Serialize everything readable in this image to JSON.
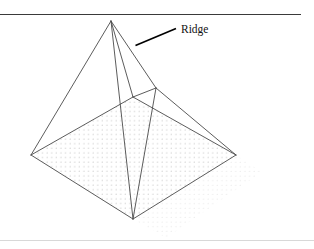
{
  "figure": {
    "type": "line-diagram",
    "background_color": "#ffffff",
    "canvas": {
      "width": 314,
      "height": 249
    }
  },
  "rules": {
    "top": {
      "name": "top-horizontal-rule",
      "x1": 0,
      "y1": 14.5,
      "x2": 301,
      "y2": 14.5,
      "color": "#3a3a3a",
      "width": 1.1
    },
    "bottom": {
      "name": "bottom-horizontal-rule",
      "x1": 0,
      "y1": 240.5,
      "x2": 314,
      "y2": 240.5,
      "color": "#d8d8d8",
      "width": 1
    }
  },
  "annotation": {
    "label": "Ridge",
    "label_x": 181,
    "label_y": 33,
    "label_color": "#111111",
    "leader": {
      "name": "ridge-leader-line",
      "x1": 135.5,
      "y1": 45.5,
      "x2": 176,
      "y2": 28.5,
      "color": "#000000",
      "width": 1.7
    }
  },
  "geometry": {
    "stroke_color": "#4a4a4a",
    "stroke_width": 0.85,
    "points": {
      "apex": {
        "x": 111,
        "y": 21
      },
      "ridge_end": {
        "x": 156,
        "y": 88
      },
      "base_left": {
        "x": 31,
        "y": 155
      },
      "base_back": {
        "x": 133,
        "y": 97
      },
      "base_right": {
        "x": 236,
        "y": 155
      },
      "base_front": {
        "x": 133,
        "y": 219
      }
    },
    "edges": [
      {
        "name": "ridge-edge",
        "from": "apex",
        "to": "ridge_end"
      },
      {
        "name": "hip-apex-to-left",
        "from": "apex",
        "to": "base_left"
      },
      {
        "name": "hip-apex-to-back",
        "from": "apex",
        "to": "base_back"
      },
      {
        "name": "hip-apex-to-front",
        "from": "apex",
        "to": "base_front"
      },
      {
        "name": "hip-ridge-to-back",
        "from": "ridge_end",
        "to": "base_back"
      },
      {
        "name": "hip-ridge-to-right",
        "from": "ridge_end",
        "to": "base_right"
      },
      {
        "name": "hip-ridge-to-front",
        "from": "ridge_end",
        "to": "base_front"
      },
      {
        "name": "base-edge-left-back",
        "from": "base_left",
        "to": "base_back"
      },
      {
        "name": "base-edge-back-right",
        "from": "base_back",
        "to": "base_right"
      },
      {
        "name": "base-edge-right-front",
        "from": "base_right",
        "to": "base_front"
      },
      {
        "name": "base-edge-front-left",
        "from": "base_front",
        "to": "base_left"
      }
    ]
  },
  "base_plane": {
    "name": "stippled-base-plane",
    "fill_pattern": "dot-grid",
    "dot_color": "#bdbdbd",
    "dot_spacing": 4.6,
    "dot_radius": 0.5,
    "polygon": "31,155 133,97 236,155 133,219"
  },
  "ground_shadow": {
    "name": "ground-shadow-plane",
    "fill_pattern": "dot-grid",
    "dot_color": "#d6d6d6",
    "polygon": "133,219 236,155 262,172 166,238"
  }
}
